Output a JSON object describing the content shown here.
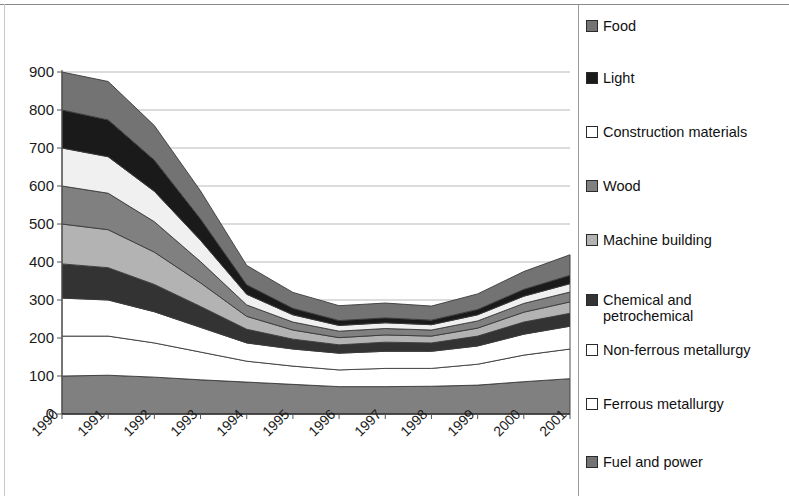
{
  "chart_data": {
    "type": "area",
    "stacked": true,
    "title": "",
    "subtitle": "",
    "xlabel": "",
    "ylabel": "",
    "grid": true,
    "grid_axis": "y",
    "legend_position": "right",
    "xlim": [
      1990,
      2001
    ],
    "ylim": [
      0,
      900
    ],
    "yticks": [
      0,
      100,
      200,
      300,
      400,
      500,
      600,
      700,
      800,
      900
    ],
    "ytick_labels": [
      "0",
      "100",
      "200",
      "300",
      "400",
      "500",
      "600",
      "700",
      "800",
      "900"
    ],
    "categories": [
      "1990",
      "1991",
      "1992",
      "1993",
      "1994",
      "1995",
      "1996",
      "1997",
      "1998",
      "1999",
      "2000",
      "2001"
    ],
    "x": [
      1990,
      1991,
      1992,
      1993,
      1994,
      1995,
      1996,
      1997,
      1998,
      1999,
      2000,
      2001
    ],
    "stack_order_bottom_to_top": [
      "Fuel and power",
      "Ferrous metallurgy",
      "Non-ferrous metallurgy",
      "Chemical and petrochemical",
      "Machine building",
      "Wood",
      "Construction materials",
      "Light",
      "Food"
    ],
    "series": [
      {
        "name": "Fuel and power",
        "color": "#808080",
        "values": [
          100,
          102,
          97,
          90,
          84,
          78,
          72,
          72,
          73,
          76,
          85,
          93
        ]
      },
      {
        "name": "Ferrous metallurgy",
        "color": "#ffffff",
        "values": [
          105,
          103,
          90,
          73,
          55,
          48,
          44,
          48,
          47,
          55,
          70,
          78
        ]
      },
      {
        "name": "Non-ferrous metallurgy",
        "color": "#ffffff",
        "values": [
          100,
          95,
          82,
          65,
          48,
          45,
          44,
          45,
          45,
          48,
          55,
          60
        ]
      },
      {
        "name": "Chemical and petrochemical",
        "color": "#333333",
        "values": [
          90,
          85,
          72,
          55,
          36,
          26,
          22,
          24,
          22,
          26,
          32,
          34
        ]
      },
      {
        "name": "Machine building",
        "color": "#b3b3b3",
        "values": [
          105,
          100,
          85,
          62,
          34,
          24,
          19,
          19,
          18,
          21,
          26,
          30
        ]
      },
      {
        "name": "Wood",
        "color": "#808080",
        "values": [
          100,
          96,
          80,
          56,
          30,
          21,
          17,
          17,
          16,
          19,
          23,
          26
        ]
      },
      {
        "name": "Construction materials",
        "color": "#f0f0f0",
        "values": [
          100,
          96,
          80,
          56,
          28,
          19,
          15,
          15,
          14,
          16,
          19,
          22
        ]
      },
      {
        "name": "Light",
        "color": "#1a1a1a",
        "values": [
          100,
          97,
          82,
          56,
          25,
          17,
          13,
          13,
          12,
          14,
          18,
          22
        ]
      },
      {
        "name": "Food",
        "color": "#737373",
        "values": [
          100,
          101,
          91,
          74,
          51,
          42,
          39,
          39,
          37,
          41,
          47,
          54
        ]
      }
    ],
    "totals": [
      900,
      875,
      759,
      587,
      391,
      320,
      285,
      292,
      284,
      316,
      375,
      419
    ]
  },
  "legend": {
    "items": [
      {
        "label": "Food",
        "color": "#737373",
        "y": 18
      },
      {
        "label": "Light",
        "color": "#1a1a1a",
        "y": 70
      },
      {
        "label": "Construction materials",
        "color": "#ffffff",
        "y": 124
      },
      {
        "label": "Wood",
        "color": "#808080",
        "y": 178
      },
      {
        "label": "Machine building",
        "color": "#b3b3b3",
        "y": 232
      },
      {
        "label": "Chemical and\npetrochemical",
        "color": "#333333",
        "y": 292
      },
      {
        "label": "Non-ferrous metallurgy",
        "color": "#ffffff",
        "y": 342
      },
      {
        "label": "Ferrous metallurgy",
        "color": "#ffffff",
        "y": 396
      },
      {
        "label": "Fuel and power",
        "color": "#737373",
        "y": 454
      }
    ]
  },
  "axis": {
    "y_labels": [
      "900",
      "800",
      "700",
      "600",
      "500",
      "400",
      "300",
      "200",
      "100",
      "0"
    ],
    "x_labels": [
      "1990",
      "1991",
      "1992",
      "1993",
      "1994",
      "1995",
      "1996",
      "1997",
      "1998",
      "1999",
      "2000",
      "2001"
    ]
  },
  "colors": {
    "grid": "#b9b9b9",
    "axis": "#555555",
    "frame": "#8a8a8a",
    "text": "#111111",
    "background": "#ffffff"
  }
}
